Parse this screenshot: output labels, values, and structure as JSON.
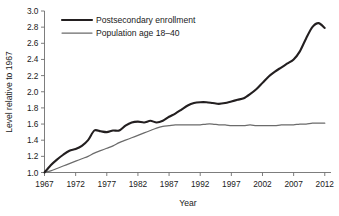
{
  "chart_data": {
    "type": "line",
    "title": "",
    "xlabel": "Year",
    "ylabel": "Level relative to 1967",
    "xlim": [
      1967,
      2013
    ],
    "ylim": [
      1.0,
      3.0
    ],
    "grid": false,
    "legend_position": "top-left",
    "xticks": [
      1967,
      1972,
      1977,
      1982,
      1987,
      1992,
      1997,
      2002,
      2007,
      2012
    ],
    "xtick_labels": [
      "1967",
      "1972",
      "1977",
      "1982",
      "1987",
      "1992",
      "1997",
      "2002",
      "2007",
      "2012"
    ],
    "yticks": [
      1.0,
      1.2,
      1.4,
      1.6,
      1.8,
      2.0,
      2.2,
      2.4,
      2.6,
      2.8,
      3.0
    ],
    "ytick_labels": [
      "1.0",
      "1.2",
      "1.4",
      "1.6",
      "1.8",
      "2.0",
      "2.2",
      "2.4",
      "2.6",
      "2.8",
      "3.0"
    ],
    "x": [
      1967,
      1968,
      1969,
      1970,
      1971,
      1972,
      1973,
      1974,
      1975,
      1976,
      1977,
      1978,
      1979,
      1980,
      1981,
      1982,
      1983,
      1984,
      1985,
      1986,
      1987,
      1988,
      1989,
      1990,
      1991,
      1992,
      1993,
      1994,
      1995,
      1996,
      1997,
      1998,
      1999,
      2000,
      2001,
      2002,
      2003,
      2004,
      2005,
      2006,
      2007,
      2008,
      2009,
      2010,
      2011,
      2012
    ],
    "series": [
      {
        "name": "Postsecondary enrollment",
        "color": "#231f20",
        "values": [
          1.0,
          1.09,
          1.16,
          1.22,
          1.27,
          1.29,
          1.33,
          1.4,
          1.52,
          1.51,
          1.5,
          1.52,
          1.52,
          1.58,
          1.62,
          1.63,
          1.62,
          1.64,
          1.62,
          1.64,
          1.69,
          1.73,
          1.78,
          1.83,
          1.86,
          1.87,
          1.87,
          1.86,
          1.85,
          1.86,
          1.88,
          1.9,
          1.92,
          1.97,
          2.03,
          2.11,
          2.19,
          2.25,
          2.3,
          2.35,
          2.4,
          2.5,
          2.66,
          2.8,
          2.85,
          2.79
        ]
      },
      {
        "name": "Population age 18–40",
        "color": "#6b6b6b",
        "values": [
          1.0,
          1.02,
          1.05,
          1.08,
          1.11,
          1.14,
          1.17,
          1.2,
          1.24,
          1.27,
          1.3,
          1.33,
          1.37,
          1.4,
          1.43,
          1.46,
          1.49,
          1.52,
          1.55,
          1.57,
          1.58,
          1.59,
          1.59,
          1.59,
          1.59,
          1.59,
          1.6,
          1.6,
          1.59,
          1.59,
          1.58,
          1.58,
          1.58,
          1.59,
          1.58,
          1.58,
          1.58,
          1.58,
          1.59,
          1.59,
          1.59,
          1.6,
          1.6,
          1.61,
          1.61,
          1.61
        ]
      }
    ]
  },
  "legend": {
    "items": [
      {
        "label": "Postsecondary enrollment"
      },
      {
        "label": "Population age 18–40"
      }
    ]
  },
  "axes": {
    "x_title": "Year",
    "y_title": "Level relative to 1967"
  }
}
